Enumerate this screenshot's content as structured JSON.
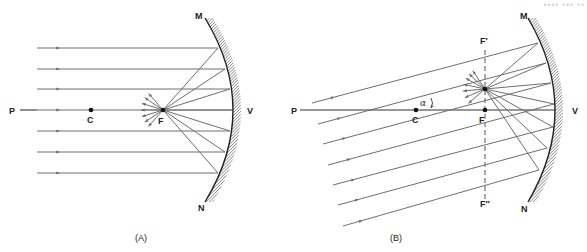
{
  "corner_text": "▪▪▪▪ ▪▪▪ ▪▪",
  "colors": {
    "ray": "#6e6e6e",
    "axis": "#333333",
    "mirror": "#222222",
    "hatch": "#555555"
  },
  "panelA": {
    "caption": "(A)",
    "labels": {
      "P": "P",
      "C": "C",
      "F": "F",
      "V": "V",
      "M": "M",
      "N": "N"
    },
    "points": {
      "C": [
        91,
        110
      ],
      "F": [
        163,
        110
      ]
    },
    "axis": {
      "x1": 20,
      "x2": 37,
      "y": 110
    },
    "mirror": {
      "top": [
        205,
        18
      ],
      "vertex": [
        233,
        110
      ],
      "bottom": [
        205,
        202
      ]
    },
    "rays": [
      {
        "y": 48,
        "hitX": 218
      },
      {
        "y": 69,
        "hitX": 225
      },
      {
        "y": 89,
        "hitX": 230
      },
      {
        "y": 110,
        "hitX": 233
      },
      {
        "y": 131,
        "hitX": 230
      },
      {
        "y": 152,
        "hitX": 225
      },
      {
        "y": 173,
        "hitX": 218
      }
    ],
    "rayStartX": 37
  },
  "panelB": {
    "caption": "(B)",
    "labels": {
      "P": "P",
      "C": "C",
      "F": "F",
      "V": "V",
      "M": "M",
      "N": "N",
      "Fprime": "F′",
      "Fdouble": "F″",
      "alpha": "α"
    },
    "points": {
      "C": [
        416,
        110
      ],
      "F": [
        485,
        110
      ],
      "Fprime": [
        485,
        89
      ]
    },
    "axis": {
      "x1": 300,
      "x2": 555,
      "y": 110
    },
    "focal_plane": {
      "x": 485,
      "y1": 50,
      "y2": 200
    },
    "mirror": {
      "top": [
        528,
        18
      ],
      "vertex": [
        555,
        110
      ],
      "bottom": [
        528,
        202
      ]
    },
    "rays": [
      {
        "start": [
          312,
          103
        ],
        "hit": [
          538,
          43
        ]
      },
      {
        "start": [
          318,
          124
        ],
        "hit": [
          546,
          63
        ]
      },
      {
        "start": [
          323,
          144
        ],
        "hit": [
          551,
          83
        ]
      },
      {
        "start": [
          328,
          165
        ],
        "hit": [
          554,
          104
        ]
      },
      {
        "start": [
          333,
          185
        ],
        "hit": [
          553,
          127
        ]
      },
      {
        "start": [
          338,
          205
        ],
        "hit": [
          547,
          148
        ]
      },
      {
        "start": [
          343,
          226
        ],
        "hit": [
          539,
          170
        ]
      }
    ]
  }
}
